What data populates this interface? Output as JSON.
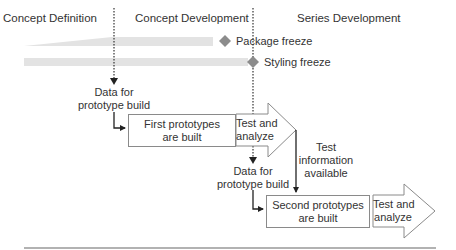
{
  "phases": [
    {
      "label": "Concept Definition"
    },
    {
      "label": "Concept Development"
    },
    {
      "label": "Series Development"
    }
  ],
  "milestones": [
    {
      "label": "Package freeze"
    },
    {
      "label": "Styling freeze"
    }
  ],
  "flow": {
    "data_for_build_1": {
      "line1": "Data for",
      "line2": "prototype build"
    },
    "first_prototypes": {
      "line1": "First prototypes",
      "line2": "are built"
    },
    "test_analyze_1": {
      "line1": "Test and",
      "line2": "analyze"
    },
    "test_info": {
      "line1": "Test",
      "line2": "information",
      "line3": "available"
    },
    "data_for_build_2": {
      "line1": "Data for",
      "line2": "prototype build"
    },
    "second_prototypes": {
      "line1": "Second prototypes",
      "line2": "are built"
    },
    "test_analyze_2": {
      "line1": "Test and",
      "line2": "analyze"
    }
  },
  "colors": {
    "bar": "#e3e3e3",
    "diamond": "#8c8c8c",
    "line": "#333333",
    "border": "#8a8a8a"
  }
}
